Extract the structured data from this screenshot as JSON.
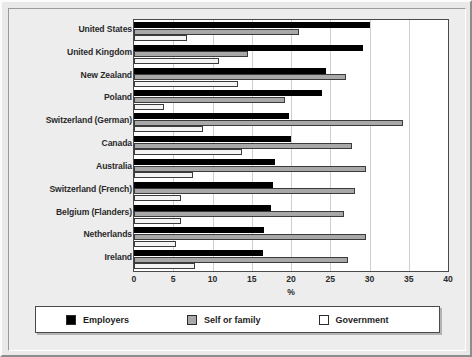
{
  "chart_data": {
    "type": "bar",
    "orientation": "horizontal",
    "title": "",
    "xlabel": "%",
    "ylabel": "",
    "xlim": [
      0,
      40
    ],
    "xticks": [
      0,
      5,
      10,
      15,
      20,
      25,
      30,
      35,
      40
    ],
    "grid": true,
    "legend_position": "bottom",
    "categories": [
      "United States",
      "United Kingdom",
      "New Zealand",
      "Poland",
      "Switzerland (German)",
      "Canada",
      "Australia",
      "Switzerland (French)",
      "Belgium (Flanders)",
      "Netherlands",
      "Ireland"
    ],
    "series": [
      {
        "name": "Employers",
        "color": "#000000",
        "values": [
          30.0,
          29.2,
          24.4,
          24.0,
          19.8,
          20.0,
          17.9,
          17.7,
          17.5,
          16.5,
          16.4
        ]
      },
      {
        "name": "Self or family",
        "color": "#a8a8a8",
        "values": [
          21.0,
          14.5,
          27.0,
          19.2,
          34.3,
          27.8,
          29.5,
          28.2,
          26.8,
          29.6,
          27.2
        ]
      },
      {
        "name": "Government",
        "color": "#ffffff",
        "values": [
          6.7,
          10.8,
          13.2,
          3.8,
          8.8,
          13.8,
          7.5,
          6.0,
          6.0,
          5.4,
          7.8
        ]
      }
    ]
  },
  "legend": {
    "items": [
      {
        "label": "Employers",
        "swatch": "black-swatch"
      },
      {
        "label": "Self or family",
        "swatch": "gray-swatch"
      },
      {
        "label": "Government",
        "swatch": "white-swatch"
      }
    ]
  }
}
